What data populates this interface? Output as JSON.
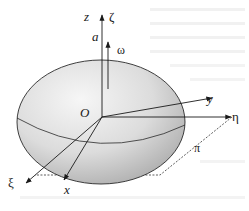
{
  "figure": {
    "type": "3D ellipsoid with rotating and fixed coordinate axes",
    "colors": {
      "background": "#ffffff",
      "body_light": "#f2f2f2",
      "body_dark": "#a8a8a8",
      "line": "#1a1a1a"
    },
    "labels": {
      "origin": "O",
      "z_axis": "z",
      "zeta_axis": "ζ",
      "semi_axis": "a",
      "omega": "ω",
      "y_axis": "y",
      "eta_axis": "η",
      "xi_axis": "ξ",
      "x_axis": "x",
      "plane": "π"
    },
    "axes": [
      {
        "name": "z",
        "label": "z",
        "direction": "up",
        "style": "solid-arrow"
      },
      {
        "name": "zeta",
        "label": "ζ",
        "direction": "up",
        "style": "shared with z"
      },
      {
        "name": "omega",
        "label": "ω",
        "direction": "up",
        "style": "angular velocity arrow"
      },
      {
        "name": "y",
        "label": "y",
        "direction": "right-up",
        "style": "solid-arrow"
      },
      {
        "name": "eta",
        "label": "η",
        "direction": "right",
        "style": "solid-arrow"
      },
      {
        "name": "xi",
        "label": "ξ",
        "direction": "down-left",
        "style": "solid-arrow"
      },
      {
        "name": "x",
        "label": "x",
        "direction": "down",
        "style": "solid-arrow"
      }
    ],
    "plane": {
      "label": "π",
      "style": "dashed parallelogram (horizontal plane)"
    }
  }
}
